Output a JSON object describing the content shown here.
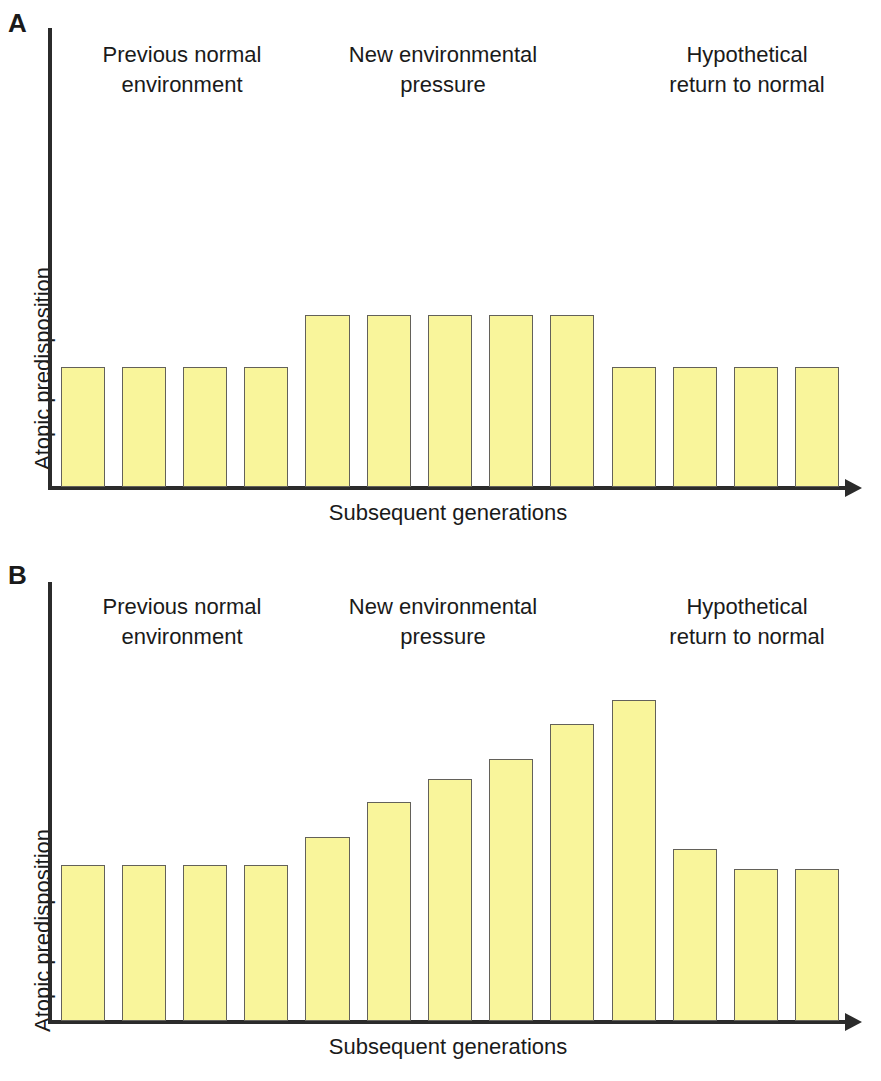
{
  "figure": {
    "panels": [
      {
        "letter": "A",
        "axis": {
          "ylabel": "Atopic predisposition",
          "xlabel": "Subsequent generations"
        },
        "regions": [
          {
            "line1": "Previous normal",
            "line2": "environment"
          },
          {
            "line1": "New environmental",
            "line2": "pressure"
          },
          {
            "line1": "Hypothetical",
            "line2": "return to normal"
          }
        ]
      },
      {
        "letter": "B",
        "axis": {
          "ylabel": "Atopic predisposition",
          "xlabel": "Subsequent generations"
        },
        "regions": [
          {
            "line1": "Previous normal",
            "line2": "environment"
          },
          {
            "line1": "New environmental",
            "line2": "pressure"
          },
          {
            "line1": "Hypothetical",
            "line2": "return to normal"
          }
        ]
      }
    ],
    "colors": {
      "bar_fill": "#f9f59b",
      "bar_stroke": "#63615a",
      "axis": "#2b2b2b",
      "text": "#1a1a1a",
      "background": "#ffffff"
    }
  },
  "chart_data": [
    {
      "type": "bar",
      "panel": "A",
      "title": "",
      "xlabel": "Subsequent generations",
      "ylabel": "Atopic predisposition",
      "ylim": [
        0,
        100
      ],
      "grid": false,
      "legend": "none",
      "categories": [
        "1",
        "2",
        "3",
        "4",
        "5",
        "6",
        "7",
        "8",
        "9",
        "10",
        "11",
        "12",
        "13"
      ],
      "values": [
        40,
        40,
        40,
        40,
        57,
        57,
        57,
        57,
        57,
        40,
        40,
        40,
        40
      ],
      "annotations": [
        {
          "text": "Previous normal environment",
          "spans_bars": [
            1,
            4
          ]
        },
        {
          "text": "New environmental pressure",
          "spans_bars": [
            5,
            9
          ]
        },
        {
          "text": "Hypothetical return to normal",
          "spans_bars": [
            10,
            13
          ]
        }
      ]
    },
    {
      "type": "bar",
      "panel": "B",
      "title": "",
      "xlabel": "Subsequent generations",
      "ylabel": "Atopic predisposition",
      "ylim": [
        0,
        100
      ],
      "grid": false,
      "legend": "none",
      "categories": [
        "1",
        "2",
        "3",
        "4",
        "5",
        "6",
        "7",
        "8",
        "9",
        "10",
        "11",
        "12",
        "13"
      ],
      "values": [
        40,
        40,
        40,
        40,
        47,
        56,
        62,
        67,
        76,
        82,
        44,
        39,
        39
      ],
      "annotations": [
        {
          "text": "Previous normal environment",
          "spans_bars": [
            1,
            4
          ]
        },
        {
          "text": "New environmental pressure",
          "spans_bars": [
            5,
            10
          ]
        },
        {
          "text": "Hypothetical return to normal",
          "spans_bars": [
            11,
            13
          ]
        }
      ]
    }
  ]
}
